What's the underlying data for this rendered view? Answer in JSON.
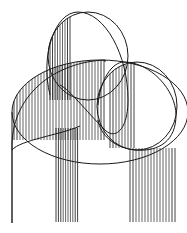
{
  "illustration": {
    "subject": "abstract intersecting ribbon loops with vertical hatching",
    "background": "#ffffff",
    "ink": "#1a1a1a",
    "canvas": {
      "width": 187,
      "height": 233
    },
    "loops": [
      {
        "name": "top-loop",
        "outline": "M50,95 C40,55 55,12 78,12 C105,12 128,55 128,100 C128,130 115,140 105,130 C85,110 70,90 60,85"
      },
      {
        "name": "left-loop",
        "outline": "M12,150 C10,95 55,62 105,60 L105,62 M12,150 C20,140 60,135 80,126"
      },
      {
        "name": "right-loop",
        "outline": "M98,105 C100,80 112,62 124,62 C150,62 176,90 176,115 C176,140 160,152 135,150 C115,148 100,135 98,120"
      }
    ],
    "hatch_groups": [
      {
        "name": "top-loop-hatch",
        "x_from": 50,
        "x_to": 72,
        "step": 2.5,
        "y_top_curve": "top",
        "y_bottom": 100
      },
      {
        "name": "left-loop-hatch",
        "x_from": 14,
        "x_to": 104,
        "step": 3,
        "y_top_curve": "left",
        "y_bottom": 140
      },
      {
        "name": "right-loop-hatch",
        "x_from": 110,
        "x_to": 134,
        "step": 3,
        "y_top_curve": "right",
        "y_bottom": 148
      },
      {
        "name": "middle-leg-hatch",
        "x_from": 56,
        "x_to": 79,
        "step": 2.4,
        "y_top": 128,
        "y_bottom": 222
      },
      {
        "name": "right-leg-hatch",
        "x_from": 130,
        "x_to": 176,
        "step": 3,
        "y_top": 148,
        "y_bottom": 222
      },
      {
        "name": "left-leg-line",
        "x_from": 12,
        "x_to": 12,
        "step": 1,
        "y_top": 150,
        "y_bottom": 223
      }
    ]
  }
}
